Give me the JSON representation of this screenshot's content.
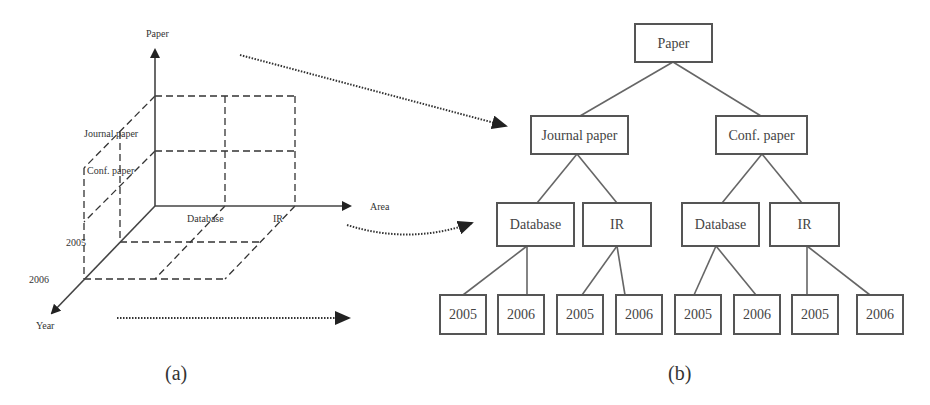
{
  "panel_a": {
    "caption": "(a)",
    "axes": {
      "vertical": "Paper",
      "horizontal": "Area",
      "depth": "Year"
    },
    "paper_labels": [
      "Journal paper",
      "Conf. paper"
    ],
    "area_labels": [
      "Database",
      "IR"
    ],
    "year_labels": [
      "2005",
      "2006"
    ]
  },
  "panel_b": {
    "caption": "(b)",
    "tree": {
      "root": "Paper",
      "level1": [
        "Journal paper",
        "Conf. paper"
      ],
      "level2": [
        "Database",
        "IR",
        "Database",
        "IR"
      ],
      "level3": [
        "2005",
        "2006",
        "2005",
        "2006",
        "2005",
        "2006",
        "2005",
        "2006"
      ]
    }
  },
  "connectors": [
    "paper-dimension-to-level1",
    "area-dimension-to-level2",
    "year-dimension-to-level3"
  ]
}
